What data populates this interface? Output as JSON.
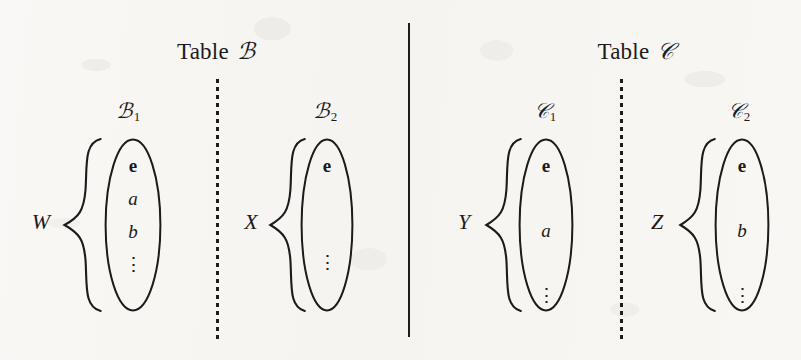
{
  "figure": {
    "kind": "set-partition-diagram",
    "ink_color": "#1b1b1b",
    "paper_color": "#f6f4f0"
  },
  "sections": [
    {
      "id": "table-b",
      "header": "Table",
      "header_symbol": "ℬ",
      "header_center_x": 216,
      "header_y": 40,
      "dotted_divider_x": 216,
      "groups": [
        {
          "id": "b1",
          "title_symbol": "ℬ",
          "title_subscript": "1",
          "title_center_x": 128,
          "title_y": 101,
          "set_label": "W",
          "set_label_x": 41,
          "set_label_y": 222,
          "brace_x": 62,
          "brace_y": 137,
          "brace_w": 42,
          "brace_h": 176,
          "bubble_x": 104,
          "bubble_y": 138,
          "bubble_w": 58,
          "bubble_h": 174,
          "items": [
            {
              "text": "e",
              "style": "bold"
            },
            {
              "text": "a",
              "style": "ital"
            },
            {
              "text": "b",
              "style": "ital"
            },
            {
              "text": "⋮",
              "style": "vdots"
            }
          ],
          "items_top": 18,
          "items_gap": 14
        },
        {
          "id": "b2",
          "title_symbol": "ℬ",
          "title_subscript": "2",
          "title_center_x": 325,
          "title_y": 101,
          "set_label": "X",
          "set_label_x": 251,
          "set_label_y": 222,
          "brace_x": 268,
          "brace_y": 137,
          "brace_w": 40,
          "brace_h": 176,
          "bubble_x": 300,
          "bubble_y": 138,
          "bubble_w": 54,
          "bubble_h": 174,
          "items": [
            {
              "text": "e",
              "style": "bold"
            },
            {
              "text": "⋮",
              "style": "vdots"
            }
          ],
          "items_top": 18,
          "items_gap": 78
        }
      ]
    },
    {
      "id": "table-c",
      "header": "Table",
      "header_symbol": "𝒞",
      "header_center_x": 636,
      "header_y": 40,
      "dotted_divider_x": 620,
      "groups": [
        {
          "id": "c1",
          "title_symbol": "𝒞",
          "title_subscript": "1",
          "title_center_x": 545,
          "title_y": 101,
          "set_label": "Y",
          "set_label_x": 464,
          "set_label_y": 222,
          "brace_x": 484,
          "brace_y": 137,
          "brace_w": 40,
          "brace_h": 176,
          "bubble_x": 518,
          "bubble_y": 138,
          "bubble_w": 56,
          "bubble_h": 174,
          "items": [
            {
              "text": "e",
              "style": "bold"
            },
            {
              "text": "a",
              "style": "ital"
            },
            {
              "text": "⋮",
              "style": "vdots"
            }
          ],
          "items_top": 18,
          "items_gap": 46
        },
        {
          "id": "c2",
          "title_symbol": "𝒞",
          "title_subscript": "2",
          "title_center_x": 739,
          "title_y": 101,
          "set_label": "Z",
          "set_label_x": 657,
          "set_label_y": 222,
          "brace_x": 678,
          "brace_y": 137,
          "brace_w": 40,
          "brace_h": 176,
          "bubble_x": 714,
          "bubble_y": 138,
          "bubble_w": 56,
          "bubble_h": 174,
          "items": [
            {
              "text": "e",
              "style": "bold"
            },
            {
              "text": "b",
              "style": "ital"
            },
            {
              "text": "⋮",
              "style": "vdots"
            }
          ],
          "items_top": 18,
          "items_gap": 46
        }
      ]
    }
  ],
  "solid_divider": {
    "x": 408,
    "y": 23,
    "height": 314
  },
  "dotted_divider_span": {
    "y": 79,
    "height": 262
  }
}
